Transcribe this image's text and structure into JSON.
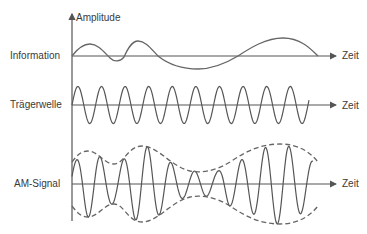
{
  "diagram": {
    "y_axis_label": "Amplitude",
    "rows": [
      {
        "label": "Information",
        "x_axis_label": "Zeit"
      },
      {
        "label": "Trägerwelle",
        "x_axis_label": "Zeit"
      },
      {
        "label": "AM-Signal",
        "x_axis_label": "Zeit"
      }
    ],
    "colors": {
      "line": "#555555",
      "text": "#3a3a3a",
      "background": "#ffffff"
    }
  }
}
